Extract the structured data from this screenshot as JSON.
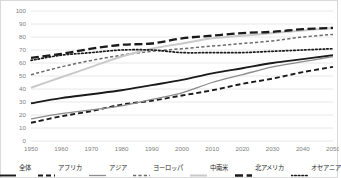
{
  "chart_data": {
    "type": "line",
    "title": "",
    "subtitle": "",
    "xlabel": "",
    "ylabel": "",
    "xlim": [
      1950,
      2050
    ],
    "ylim": [
      0,
      100
    ],
    "ytick_step": 10,
    "grid": "horizontal",
    "legend_position": "bottom",
    "x": [
      1950,
      1960,
      1970,
      1980,
      1990,
      2000,
      2010,
      2020,
      2030,
      2040,
      2050
    ],
    "xticks": [
      "1950",
      "1960",
      "1970",
      "1980",
      "1990",
      "2000",
      "2010",
      "2020",
      "2030",
      "2040",
      "2050"
    ],
    "yticks": [
      "0",
      "10",
      "20",
      "30",
      "40",
      "50",
      "60",
      "70",
      "80",
      "90",
      "100"
    ],
    "series": [
      {
        "name": "全体",
        "key": "world",
        "style": "solid",
        "color": "#1a1a1a",
        "width": 1.9,
        "values": [
          29,
          33,
          36,
          39,
          43,
          47,
          52,
          56,
          60,
          63,
          66
        ]
      },
      {
        "name": "アフリカ",
        "key": "africa",
        "style": "dashed",
        "color": "#1a1a1a",
        "width": 1.9,
        "values": [
          14,
          19,
          23,
          28,
          31,
          35,
          39,
          44,
          48,
          53,
          57
        ]
      },
      {
        "name": "アジア",
        "key": "asia",
        "style": "solid",
        "color": "#8c8c8c",
        "width": 1.3,
        "values": [
          17,
          21,
          24,
          27,
          32,
          37,
          45,
          51,
          57,
          61,
          65
        ]
      },
      {
        "name": "ヨーロッパ",
        "key": "europe",
        "style": "dashed-short",
        "color": "#6b6b6b",
        "width": 1.5,
        "values": [
          51,
          57,
          62,
          66,
          69,
          71,
          73,
          75,
          77,
          80,
          82
        ]
      },
      {
        "name": "中南米",
        "key": "latin-america",
        "style": "solid",
        "color": "#c9c9c9",
        "width": 2.0,
        "values": [
          41,
          49,
          57,
          65,
          71,
          75,
          79,
          81,
          83,
          85,
          87
        ]
      },
      {
        "name": "北アメリカ",
        "key": "north-america",
        "style": "dash-long",
        "color": "#1a1a1a",
        "width": 2.3,
        "values": [
          64,
          67,
          71,
          74,
          75,
          79,
          81,
          83,
          84,
          86,
          87
        ]
      },
      {
        "name": "オセアニア",
        "key": "oceania",
        "style": "dotted",
        "color": "#1a1a1a",
        "width": 1.7,
        "values": [
          62,
          66,
          68,
          70,
          70,
          68,
          68,
          68,
          69,
          70,
          71
        ]
      }
    ]
  },
  "legend": {
    "items": [
      {
        "label": "全体",
        "key": "world"
      },
      {
        "label": "アフリカ",
        "key": "africa"
      },
      {
        "label": "アジア",
        "key": "asia"
      },
      {
        "label": "ヨーロッパ",
        "key": "europe"
      },
      {
        "label": "中南米",
        "key": "latin-america"
      },
      {
        "label": "北アメリカ",
        "key": "north-america"
      },
      {
        "label": "オセアニア",
        "key": "oceania"
      }
    ]
  },
  "colors": {
    "axis_text": "#808080",
    "grid": "#e8e8e8",
    "border": "#d9d9d9",
    "background": "#ffffff"
  }
}
